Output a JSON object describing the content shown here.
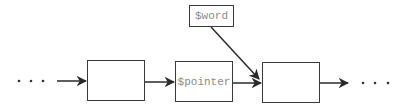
{
  "diagram": {
    "type": "linked-list",
    "nodes": [
      {
        "id": "node-1",
        "label": ""
      },
      {
        "id": "node-2",
        "label": "$pointer"
      },
      {
        "id": "node-3",
        "label": ""
      }
    ],
    "external": {
      "id": "word",
      "label": "$word",
      "points_to": "node-3"
    },
    "ellipsis_left": "...",
    "ellipsis_right": "...",
    "colors": {
      "line": "#3a3a3a",
      "label": "#8a8a8a",
      "background": "#ffffff"
    }
  }
}
